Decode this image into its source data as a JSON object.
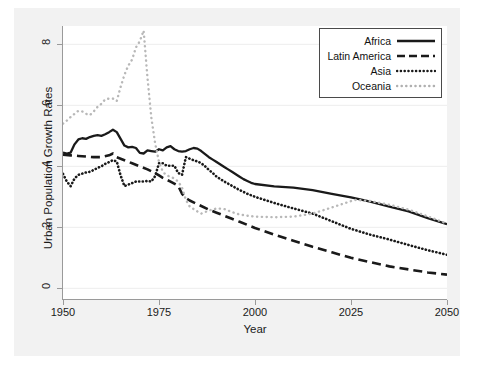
{
  "chart_data": {
    "type": "line",
    "title": "",
    "xlabel": "Year",
    "ylabel": "Urban Population Growth Rates",
    "xlim": [
      1950,
      2050
    ],
    "ylim": [
      -0.35,
      8.6
    ],
    "xticks": [
      1950,
      1975,
      2000,
      2025,
      2050
    ],
    "yticks": [
      0,
      2,
      4,
      6,
      8
    ],
    "grid": "horizontal",
    "legend_position": "top-right",
    "series": [
      {
        "name": "Africa",
        "style": "solid",
        "color": "#1a1a1a",
        "x": [
          1950,
          1951,
          1952,
          1953,
          1954,
          1955,
          1956,
          1957,
          1958,
          1959,
          1960,
          1961,
          1962,
          1963,
          1964,
          1965,
          1966,
          1967,
          1968,
          1969,
          1970,
          1971,
          1972,
          1973,
          1974,
          1975,
          1976,
          1977,
          1978,
          1979,
          1980,
          1981,
          1982,
          1983,
          1984,
          1985,
          1986,
          1987,
          1988,
          1989,
          1990,
          1991,
          1992,
          1993,
          1994,
          1995,
          1996,
          1997,
          1998,
          1999,
          2000,
          2005,
          2010,
          2015,
          2020,
          2025,
          2030,
          2035,
          2040,
          2045,
          2050
        ],
        "y": [
          4.45,
          4.42,
          4.45,
          4.72,
          4.88,
          4.92,
          4.9,
          4.96,
          5.0,
          5.02,
          5.0,
          5.05,
          5.12,
          5.2,
          5.12,
          4.9,
          4.68,
          4.62,
          4.64,
          4.6,
          4.44,
          4.42,
          4.52,
          4.5,
          4.48,
          4.56,
          4.52,
          4.62,
          4.66,
          4.56,
          4.5,
          4.48,
          4.5,
          4.56,
          4.6,
          4.58,
          4.5,
          4.4,
          4.3,
          4.22,
          4.14,
          4.06,
          3.98,
          3.9,
          3.82,
          3.74,
          3.66,
          3.58,
          3.52,
          3.46,
          3.42,
          3.34,
          3.3,
          3.22,
          3.1,
          2.98,
          2.84,
          2.68,
          2.52,
          2.3,
          2.1
        ]
      },
      {
        "name": "Latin America",
        "style": "dashed",
        "color": "#1a1a1a",
        "x": [
          1950,
          1952,
          1954,
          1956,
          1958,
          1960,
          1962,
          1963,
          1964,
          1966,
          1968,
          1970,
          1972,
          1974,
          1975,
          1976,
          1978,
          1980,
          1981,
          1982,
          1983,
          1984,
          1985,
          1986,
          1988,
          1990,
          1992,
          1994,
          1996,
          1998,
          2000,
          2005,
          2010,
          2015,
          2020,
          2025,
          2030,
          2035,
          2040,
          2045,
          2050
        ],
        "y": [
          4.38,
          4.36,
          4.34,
          4.32,
          4.3,
          4.3,
          4.36,
          4.42,
          4.3,
          4.2,
          4.1,
          4.0,
          3.9,
          3.78,
          3.7,
          3.62,
          3.5,
          3.36,
          3.1,
          2.96,
          2.88,
          2.82,
          2.76,
          2.7,
          2.58,
          2.48,
          2.38,
          2.28,
          2.18,
          2.08,
          1.98,
          1.76,
          1.56,
          1.36,
          1.18,
          1.0,
          0.86,
          0.72,
          0.62,
          0.52,
          0.45
        ]
      },
      {
        "name": "Asia",
        "style": "dotted-dense",
        "color": "#1a1a1a",
        "x": [
          1950,
          1951,
          1952,
          1953,
          1954,
          1955,
          1956,
          1957,
          1958,
          1959,
          1960,
          1961,
          1962,
          1963,
          1964,
          1965,
          1966,
          1967,
          1968,
          1969,
          1970,
          1971,
          1972,
          1973,
          1974,
          1975,
          1976,
          1977,
          1978,
          1979,
          1980,
          1981,
          1982,
          1983,
          1984,
          1985,
          1986,
          1987,
          1988,
          1989,
          1990,
          1992,
          1994,
          1996,
          1998,
          2000,
          2005,
          2010,
          2015,
          2020,
          2025,
          2030,
          2035,
          2040,
          2045,
          2050
        ],
        "y": [
          3.75,
          3.5,
          3.35,
          3.6,
          3.72,
          3.76,
          3.8,
          3.82,
          3.88,
          3.95,
          4.0,
          4.08,
          4.14,
          4.2,
          4.16,
          3.7,
          3.35,
          3.4,
          3.45,
          3.5,
          3.5,
          3.5,
          3.52,
          3.5,
          3.68,
          4.1,
          4.1,
          4.02,
          4.02,
          4.02,
          3.78,
          3.72,
          4.3,
          4.25,
          4.2,
          4.16,
          4.1,
          4.0,
          3.88,
          3.78,
          3.66,
          3.5,
          3.36,
          3.22,
          3.1,
          3.0,
          2.8,
          2.62,
          2.45,
          2.2,
          1.95,
          1.76,
          1.6,
          1.42,
          1.25,
          1.1
        ]
      },
      {
        "name": "Oceania",
        "style": "dotted-sparse",
        "color": "#b8b8b8",
        "x": [
          1950,
          1951,
          1952,
          1953,
          1954,
          1955,
          1956,
          1957,
          1958,
          1959,
          1960,
          1961,
          1962,
          1963,
          1964,
          1965,
          1966,
          1967,
          1968,
          1969,
          1970,
          1971,
          1972,
          1973,
          1974,
          1975,
          1976,
          1977,
          1978,
          1979,
          1980,
          1981,
          1982,
          1983,
          1984,
          1985,
          1986,
          1988,
          1990,
          1992,
          1994,
          1996,
          1998,
          2000,
          2005,
          2010,
          2015,
          2020,
          2025,
          2026,
          2030,
          2035,
          2040,
          2045,
          2050
        ],
        "y": [
          5.4,
          5.5,
          5.62,
          5.72,
          5.82,
          5.8,
          5.72,
          5.68,
          5.8,
          5.95,
          6.05,
          6.2,
          6.22,
          6.22,
          6.14,
          6.6,
          7.0,
          7.3,
          7.5,
          7.9,
          8.1,
          8.45,
          6.9,
          5.6,
          4.75,
          4.15,
          3.82,
          3.7,
          3.66,
          3.6,
          3.5,
          3.3,
          2.9,
          2.68,
          2.6,
          2.52,
          2.45,
          2.55,
          2.62,
          2.6,
          2.5,
          2.42,
          2.38,
          2.35,
          2.33,
          2.35,
          2.45,
          2.65,
          2.86,
          2.9,
          2.86,
          2.74,
          2.58,
          2.36,
          2.12
        ]
      }
    ]
  },
  "axis": {
    "y_title": "Urban Population Growth Rates",
    "x_title": "Year",
    "y_ticks": [
      "0",
      "2",
      "4",
      "6",
      "8"
    ],
    "x_ticks": [
      "1950",
      "1975",
      "2000",
      "2025",
      "2050"
    ]
  },
  "legend": {
    "items": [
      {
        "label": "Africa"
      },
      {
        "label": "Latin America"
      },
      {
        "label": "Asia"
      },
      {
        "label": "Oceania"
      }
    ]
  }
}
